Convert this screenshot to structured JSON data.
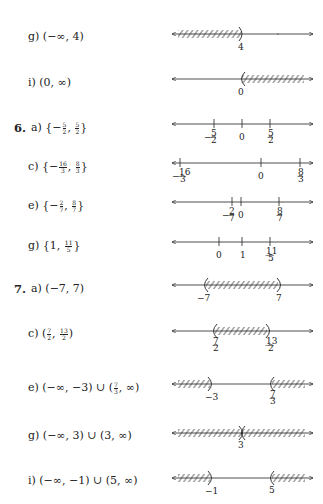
{
  "problems": [
    {
      "id": "5g",
      "number": "",
      "part": "g)",
      "answer": "(−∞, 4)",
      "y": 34
    },
    {
      "id": "5i",
      "number": "",
      "part": "i)",
      "answer": "(0, ∞)",
      "y": 79
    },
    {
      "id": "6a",
      "number": "6.",
      "part": "a)",
      "answer": "{−5/2, 5/2}",
      "y": 125
    },
    {
      "id": "6c",
      "number": "",
      "part": "c)",
      "answer": "{−16/3, 8/3}",
      "y": 164
    },
    {
      "id": "6e",
      "number": "",
      "part": "e)",
      "answer": "{−2/7, 8/7}",
      "y": 203
    },
    {
      "id": "6g",
      "number": "",
      "part": "g)",
      "answer": "{1, 11/5}",
      "y": 243
    },
    {
      "id": "7a",
      "number": "7.",
      "part": "a)",
      "answer": "(−7, 7)",
      "y": 285
    },
    {
      "id": "7c",
      "number": "",
      "part": "c)",
      "answer": "(7/2, 13/2)",
      "y": 331
    },
    {
      "id": "7e",
      "number": "",
      "part": "e)",
      "answer": "(−∞, −3) ∪ (7/3, ∞)",
      "y": 384
    },
    {
      "id": "7g",
      "number": "",
      "part": "g)",
      "answer": "(−∞, 3) ∪ (3, ∞)",
      "y": 432
    },
    {
      "id": "7i",
      "number": "",
      "part": "i)",
      "answer": "(−∞, −1) ∪ (5, ∞)",
      "y": 478
    }
  ],
  "labels": {
    "p5g": {
      "part": "g)",
      "answer": "(−∞, 4)",
      "ticks": [
        "4"
      ]
    },
    "p5i": {
      "part": "i)",
      "answer": "(0, ∞)",
      "ticks": [
        "0"
      ]
    },
    "p6a": {
      "num": "6.",
      "part": "a)",
      "pre": "{−",
      "f1n": "5",
      "f1d": "2",
      "mid": ", ",
      "f2n": "5",
      "f2d": "2",
      "post": "}",
      "ticks": [
        "−5/2",
        "0",
        "5/2"
      ]
    },
    "p6c": {
      "part": "c)",
      "pre": "{−",
      "f1n": "16",
      "f1d": "3",
      "mid": ", ",
      "f2n": "8",
      "f2d": "3",
      "post": "}",
      "ticks": [
        "−16/3",
        "0",
        "8/3"
      ]
    },
    "p6e": {
      "part": "e)",
      "pre": "{−",
      "f1n": "2",
      "f1d": "7",
      "mid": ", ",
      "f2n": "8",
      "f2d": "7",
      "post": "}",
      "ticks": [
        "−2/7",
        "0",
        "8/7"
      ]
    },
    "p6g": {
      "part": "g)",
      "pre": "{1, ",
      "f2n": "11",
      "f2d": "5",
      "post": "}",
      "ticks": [
        "0",
        "1",
        "11/5"
      ]
    },
    "p7a": {
      "num": "7.",
      "part": "a)",
      "answer": "(−7, 7)",
      "ticks": [
        "−7",
        "7"
      ]
    },
    "p7c": {
      "part": "c)",
      "pre": "(",
      "f1n": "7",
      "f1d": "2",
      "mid": ", ",
      "f2n": "13",
      "f2d": "2",
      "post": ")",
      "ticks": [
        "7/2",
        "13/2"
      ]
    },
    "p7e": {
      "part": "e)",
      "pre": "(−∞, −3) ∪ (",
      "f2n": "7",
      "f2d": "3",
      "post": ", ∞)",
      "ticks": [
        "−3",
        "7/3"
      ]
    },
    "p7g": {
      "part": "g)",
      "answer": "(−∞, 3) ∪ (3, ∞)",
      "ticks": [
        "3"
      ]
    },
    "p7i": {
      "part": "i)",
      "answer": "(−∞, −1) ∪ (5, ∞)",
      "ticks": [
        "−1",
        "5"
      ]
    }
  },
  "tick_text": {
    "t4": "4",
    "t0": "0",
    "tm52": "−",
    "t52": "",
    "tm163": "−",
    "t1": "1",
    "tm7": "−7",
    "t7": "7",
    "tm3": "−3",
    "t3": "3",
    "tm1": "−1",
    "t5": "5",
    "f5": "5",
    "f2": "2",
    "f16": "16",
    "f3": "3",
    "f8": "8",
    "f7": "7",
    "f11": "11",
    "f13": "13"
  }
}
